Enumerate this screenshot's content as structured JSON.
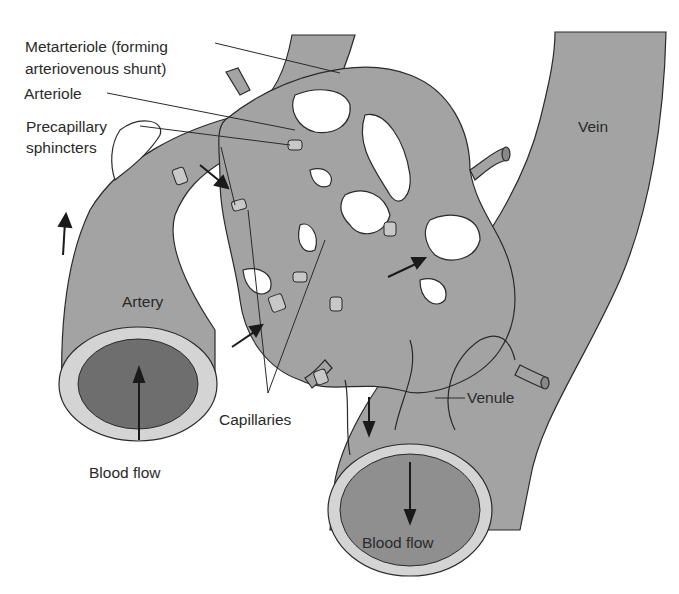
{
  "diagram": {
    "labels": {
      "metarteriole_line1": "Metarteriole (forming",
      "metarteriole_line2": "arteriovenous shunt)",
      "arteriole": "Arteriole",
      "precapillary_line1": "Precapillary",
      "precapillary_line2": "sphincters",
      "vein": "Vein",
      "artery": "Artery",
      "capillaries": "Capillaries",
      "venule": "Venule",
      "blood_flow_artery": "Blood flow",
      "blood_flow_vein": "Blood flow"
    },
    "colors": {
      "vessel_fill": "#a3a3a3",
      "vessel_wall": "#d4d4d4",
      "artery_lumen": "#6e6e6e",
      "vein_lumen": "#8f8f8f",
      "outline": "#2a2a2a",
      "background": "#ffffff"
    }
  }
}
